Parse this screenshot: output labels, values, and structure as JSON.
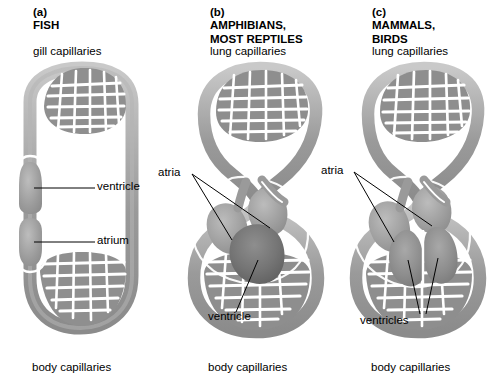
{
  "figure": {
    "background_color": "#ffffff",
    "vessel_color": "#9a9a9a",
    "vessel_dark_color": "#6f6f6f",
    "vessel_light_color": "#c4c4c4",
    "chamber_color": "#9d9d9d",
    "outline_color": "#ffffff",
    "leader_color": "#000000",
    "text_color": "#000000"
  },
  "panels": [
    {
      "id": "a",
      "letter": "(a)",
      "group": "FISH",
      "top_capillaries_label": "gill capillaries",
      "bottom_capillaries_label": "body capillaries",
      "circuit_type": "single",
      "heart_chambers": [
        "ventricle",
        "atrium"
      ],
      "callouts": [
        {
          "label": "ventricle",
          "leaders": 1
        },
        {
          "label": "atrium",
          "leaders": 1
        }
      ]
    },
    {
      "id": "b",
      "letter": "(b)",
      "group": "AMPHIBIANS,\nMOST REPTILES",
      "top_capillaries_label": "lung capillaries",
      "bottom_capillaries_label": "body capillaries",
      "circuit_type": "double",
      "heart_chambers": [
        "atria",
        "ventricle"
      ],
      "callouts": [
        {
          "label": "atria",
          "leaders": 2
        },
        {
          "label": "ventricle",
          "leaders": 1
        }
      ]
    },
    {
      "id": "c",
      "letter": "(c)",
      "group": "MAMMALS,\nBIRDS",
      "top_capillaries_label": "lung capillaries",
      "bottom_capillaries_label": "body capillaries",
      "circuit_type": "double",
      "heart_chambers": [
        "atria",
        "ventricles"
      ],
      "callouts": [
        {
          "label": "atria",
          "leaders": 2
        },
        {
          "label": "ventricles",
          "leaders": 2
        }
      ]
    }
  ]
}
